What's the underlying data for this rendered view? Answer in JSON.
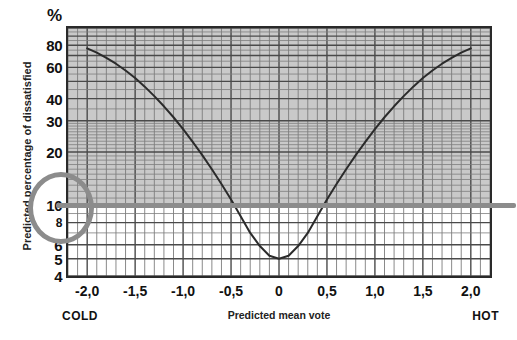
{
  "chart_data": {
    "type": "line",
    "title": "",
    "xlabel": "Predicted mean vote",
    "ylabel": "Predicted percentage of dissatisfied",
    "yunit": "%",
    "yscale": "log",
    "xlim": [
      -2.2,
      2.2
    ],
    "ylim": [
      4,
      100
    ],
    "grid": true,
    "legend": null,
    "x_ticks": [
      "-2,0",
      "-1,5",
      "-1,0",
      "-0,5",
      "0",
      "0,5",
      "1,0",
      "1,5",
      "2,0"
    ],
    "x_tick_values": [
      -2.0,
      -1.5,
      -1.0,
      -0.5,
      0,
      0.5,
      1.0,
      1.5,
      2.0
    ],
    "y_ticks": [
      "80",
      "60",
      "40",
      "30",
      "20",
      "10",
      "8",
      "6",
      "5",
      "4"
    ],
    "y_tick_values": [
      80,
      60,
      40,
      30,
      20,
      10,
      8,
      6,
      5,
      4
    ],
    "x_axis_end_labels": {
      "left": "COLD",
      "right": "HOT"
    },
    "series": [
      {
        "name": "PPD",
        "x": [
          -2.0,
          -1.9,
          -1.8,
          -1.7,
          -1.6,
          -1.5,
          -1.4,
          -1.3,
          -1.2,
          -1.1,
          -1.0,
          -0.9,
          -0.8,
          -0.7,
          -0.6,
          -0.5,
          -0.4,
          -0.3,
          -0.2,
          -0.1,
          0.0,
          0.1,
          0.2,
          0.3,
          0.4,
          0.5,
          0.6,
          0.7,
          0.8,
          0.9,
          1.0,
          1.1,
          1.2,
          1.3,
          1.4,
          1.5,
          1.6,
          1.7,
          1.8,
          1.9,
          2.0
        ],
        "values": [
          76.8,
          72.6,
          67.9,
          62.9,
          57.6,
          52.2,
          46.7,
          41.3,
          36.2,
          31.4,
          26.9,
          22.8,
          19.2,
          16.0,
          13.2,
          10.8,
          8.7,
          7.0,
          5.9,
          5.2,
          5.0,
          5.2,
          5.9,
          7.0,
          8.7,
          10.8,
          13.2,
          16.0,
          19.2,
          22.8,
          26.9,
          31.4,
          36.2,
          41.3,
          46.7,
          52.2,
          57.6,
          62.9,
          67.9,
          72.6,
          76.8
        ]
      }
    ],
    "annotations": [
      {
        "name": "acceptability-threshold-line",
        "type": "hline",
        "y": 10,
        "color": "#8c8c8c",
        "label": ""
      },
      {
        "name": "threshold-highlight-circle",
        "type": "circle",
        "target": "10",
        "color": "#8c8c8c"
      }
    ],
    "shaded_region": {
      "name": "dissatisfied-above-10-percent",
      "from_y": 10,
      "to_y": 100,
      "color": "#c9c9c9"
    }
  },
  "labels": {
    "percent_sign": "%",
    "y_title": "Predicted percentage of dissatisfied",
    "x_title": "Predicted mean vote",
    "cold": "COLD",
    "hot": "HOT"
  },
  "colors": {
    "curve": "#2b2b2b",
    "frame": "#2a2a2a",
    "grid_major": "#4a4a4a",
    "grid_minor": "#7d7d7d",
    "shade": "#c9c9c9",
    "annotation": "#8c8c8c",
    "background": "#ffffff"
  }
}
